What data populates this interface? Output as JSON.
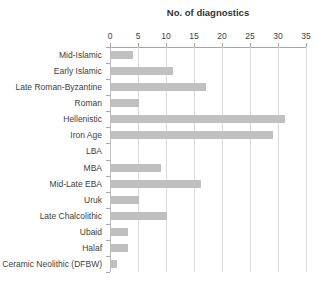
{
  "chart_data": {
    "type": "bar",
    "orientation": "horizontal",
    "title": "No. of diagnostics",
    "xlabel": "No. of diagnostics",
    "ylabel": "",
    "categories": [
      "Mid-Islamic",
      "Early Islamic",
      "Late Roman-Byzantine",
      "Roman",
      "Hellenistic",
      "Iron Age",
      "LBA",
      "MBA",
      "Mid-Late EBA",
      "Uruk",
      "Late Chalcolithic",
      "Ubaid",
      "Halaf",
      "Ceramic Neolithic (DFBW)"
    ],
    "values": [
      4,
      11,
      17,
      5,
      31,
      29,
      0,
      9,
      16,
      5,
      10,
      3,
      3,
      1
    ],
    "xlim": [
      0,
      35
    ],
    "xticks": [
      0,
      5,
      10,
      15,
      20,
      25,
      30,
      35
    ],
    "grid": true,
    "legend": false,
    "colors": {
      "bar": "#C0C0C0",
      "gridline": "#D9D9D9",
      "zero_line": "#BFBFBF",
      "axis": "#A6A6A6",
      "text": "#404040",
      "title_text": "#333333",
      "background": "#FFFFFF"
    }
  }
}
